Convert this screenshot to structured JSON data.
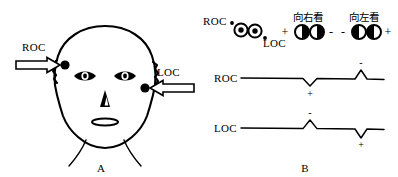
{
  "figure": {
    "panel_a": {
      "label": "A",
      "caption_role": "head-with-electrodes",
      "electrode_labels": {
        "right_outer_canthus": "ROC",
        "left_outer_canthus": "LOC"
      }
    },
    "panel_b": {
      "label": "B",
      "eye_schematic": {
        "roc_label": "ROC",
        "loc_label": "LOC"
      },
      "conditions": [
        {
          "name": "look-right",
          "title": "向右看",
          "left_sign": "+",
          "right_sign": "-",
          "gaze": "right"
        },
        {
          "name": "look-left",
          "title": "向左看",
          "left_sign": "-",
          "right_sign": "+",
          "gaze": "left"
        }
      ],
      "traces": [
        {
          "name": "roc-trace",
          "label": "ROC",
          "deflections": [
            {
              "at": "look-right",
              "direction": "down",
              "sign": "+"
            },
            {
              "at": "look-left",
              "direction": "up",
              "sign": "-"
            }
          ]
        },
        {
          "name": "loc-trace",
          "label": "LOC",
          "deflections": [
            {
              "at": "look-right",
              "direction": "up",
              "sign": "-"
            },
            {
              "at": "look-left",
              "direction": "down",
              "sign": "+"
            }
          ]
        }
      ]
    },
    "colors": {
      "ink": "#000000",
      "paper": "#ffffff"
    }
  }
}
